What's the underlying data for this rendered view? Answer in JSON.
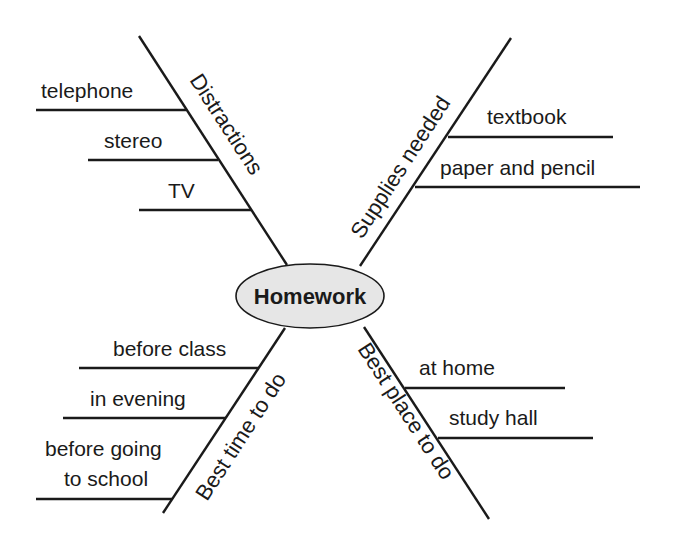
{
  "center": {
    "label": "Homework",
    "fill": "#e6e6e6"
  },
  "branches": [
    {
      "name": "Distractions",
      "items": [
        "telephone",
        "stereo",
        "TV"
      ]
    },
    {
      "name": "Supplies needed",
      "items": [
        "textbook",
        "paper and pencil"
      ]
    },
    {
      "name": "Best time to do",
      "items": [
        "before class",
        "in evening",
        "before going",
        "to school"
      ]
    },
    {
      "name": "Best place to do",
      "items": [
        "at home",
        "study hall"
      ]
    }
  ]
}
